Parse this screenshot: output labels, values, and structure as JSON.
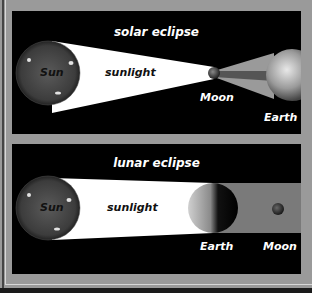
{
  "solar_eclipse": {
    "title": "solar eclipse",
    "labels": {
      "sun": "Sun",
      "sunlight": "sunlight",
      "moon": "Moon",
      "earth": "Earth"
    }
  },
  "lunar_eclipse": {
    "title": "lunar eclipse",
    "labels": {
      "sun": "Sun",
      "sunlight": "sunlight",
      "earth": "Earth",
      "moon": "Moon"
    }
  },
  "colors": {
    "background": "#9a9a9a",
    "panel": "#000000",
    "sunlight": "#ffffff",
    "shadow": "#7a7a7a"
  }
}
